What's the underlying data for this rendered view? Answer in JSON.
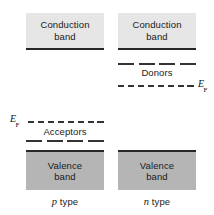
{
  "figure": {
    "colors": {
      "conduction_fill": "#e6e6e6",
      "valence_fill": "#b5b5b5",
      "band_edge": "#262626",
      "level_line": "#333333",
      "text": "#1a1a1a",
      "background": "#ffffff"
    }
  },
  "left_panel": {
    "name": "p type",
    "type_label_italic": "p",
    "type_label_rest": " type",
    "conduction_band": {
      "line1": "Conduction",
      "line2": "band"
    },
    "valence_band": {
      "line1": "Valence",
      "line2": "band"
    },
    "fermi_label": "E",
    "fermi_sub": "F",
    "dopant_level_label": "Acceptors"
  },
  "right_panel": {
    "name": "n type",
    "type_label_italic": "n",
    "type_label_rest": " type",
    "conduction_band": {
      "line1": "Conduction",
      "line2": "band"
    },
    "valence_band": {
      "line1": "Valence",
      "line2": "band"
    },
    "fermi_label": "E",
    "fermi_sub": "F",
    "dopant_level_label": "Donors"
  }
}
